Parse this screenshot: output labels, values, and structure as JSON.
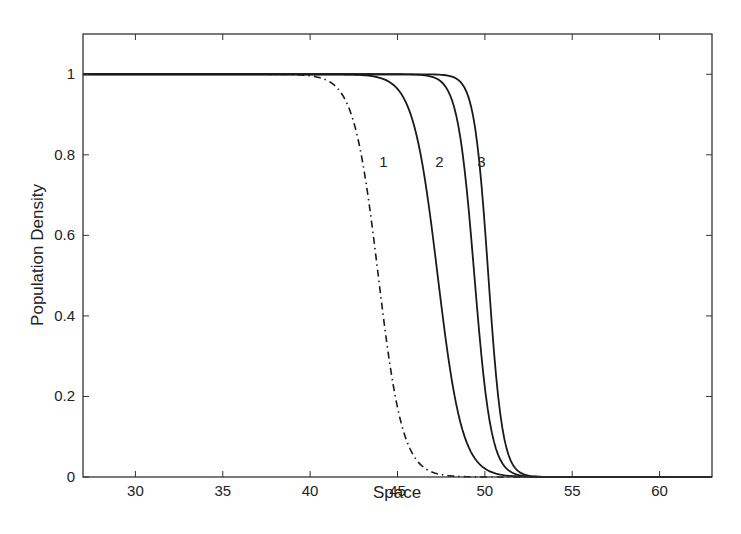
{
  "chart_data": {
    "type": "line",
    "title": "",
    "xlabel": "Space",
    "ylabel": "Population Density",
    "xlim": [
      27,
      63
    ],
    "ylim": [
      0,
      1.1
    ],
    "xticks": [
      30,
      35,
      40,
      45,
      50,
      55,
      60
    ],
    "yticks": [
      0,
      0.2,
      0.4,
      0.6,
      0.8,
      1
    ],
    "ytick_labels": [
      "0",
      "0.2",
      "0.4",
      "0.6",
      "0.8",
      "1"
    ],
    "grid": false,
    "legend": null,
    "series": [
      {
        "name": "dash-dot",
        "style": "dashdot",
        "midpoint": 43.9,
        "steepness": 0.75,
        "x": [
          27,
          30,
          33,
          36,
          38,
          40,
          42,
          43,
          44,
          45,
          46,
          48,
          50,
          52,
          55,
          63
        ],
        "values": [
          1.0,
          1.0,
          0.99,
          0.97,
          0.92,
          0.83,
          0.67,
          0.55,
          0.45,
          0.33,
          0.22,
          0.08,
          0.02,
          0.005,
          0.0,
          0.0
        ]
      },
      {
        "name": "1",
        "style": "solid",
        "midpoint": 47.3,
        "steepness": 0.75,
        "x": [
          27,
          35,
          40,
          42,
          44,
          45,
          46,
          47,
          48,
          49,
          50,
          52,
          54,
          56,
          58,
          63
        ],
        "values": [
          1.0,
          1.0,
          0.99,
          0.97,
          0.91,
          0.86,
          0.76,
          0.62,
          0.47,
          0.33,
          0.2,
          0.07,
          0.02,
          0.005,
          0.0,
          0.0
        ]
      },
      {
        "name": "2",
        "style": "solid",
        "midpoint": 49.4,
        "steepness": 1.1,
        "x": [
          27,
          40,
          44,
          46,
          47,
          48,
          49,
          50,
          51,
          52,
          53,
          55,
          57,
          63
        ],
        "values": [
          1.0,
          1.0,
          0.99,
          0.96,
          0.92,
          0.82,
          0.62,
          0.35,
          0.18,
          0.08,
          0.035,
          0.01,
          0.0,
          0.0
        ]
      },
      {
        "name": "3",
        "style": "solid",
        "midpoint": 50.2,
        "steepness": 1.3,
        "x": [
          27,
          42,
          46,
          47,
          48,
          49,
          50,
          51,
          52,
          53,
          55,
          57,
          63
        ],
        "values": [
          1.0,
          1.0,
          0.99,
          0.98,
          0.94,
          0.82,
          0.57,
          0.27,
          0.1,
          0.04,
          0.01,
          0.0,
          0.0
        ]
      }
    ],
    "annotations": [
      {
        "text": "1",
        "x": 44.2,
        "y": 0.77
      },
      {
        "text": "2",
        "x": 47.4,
        "y": 0.77
      },
      {
        "text": "3",
        "x": 49.8,
        "y": 0.77
      }
    ]
  }
}
